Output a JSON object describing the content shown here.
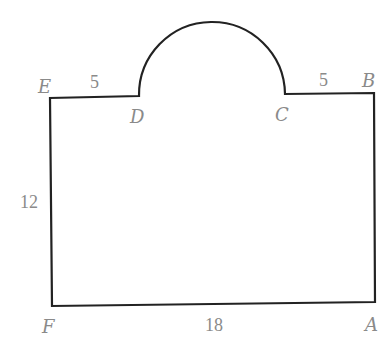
{
  "diagram": {
    "colors": {
      "stroke": "#222222",
      "label": "#8a8a8a",
      "background": "#ffffff"
    },
    "vertices": [
      {
        "name": "E",
        "label": "E"
      },
      {
        "name": "D",
        "label": "D"
      },
      {
        "name": "C",
        "label": "C"
      },
      {
        "name": "B",
        "label": "B"
      },
      {
        "name": "A",
        "label": "A"
      },
      {
        "name": "F",
        "label": "F"
      }
    ],
    "measurements": {
      "ED": "5",
      "CB": "5",
      "EF": "12",
      "FA": "18"
    }
  }
}
